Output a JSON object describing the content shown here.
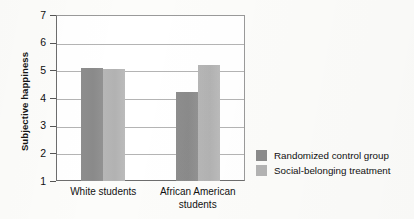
{
  "chart_data": {
    "type": "bar",
    "title": "",
    "xlabel": "",
    "ylabel": "Subjective happiness",
    "ylim": [
      1,
      7
    ],
    "yticks": [
      1,
      2,
      3,
      4,
      5,
      6,
      7
    ],
    "grid": true,
    "legend_position": "right",
    "categories": [
      "White students",
      "African American students"
    ],
    "category_lines": [
      [
        "White students",
        ""
      ],
      [
        "African American",
        "students"
      ]
    ],
    "series": [
      {
        "name": "Randomized control group",
        "color": "#8b8b8b",
        "values": [
          5.1,
          4.2
        ]
      },
      {
        "name": "Social-belonging treatment",
        "color": "#b3b3b3",
        "values": [
          5.05,
          5.2
        ]
      }
    ]
  },
  "axis": {
    "y_title": "Subjective happiness",
    "tick_labels": [
      "7",
      "6",
      "5",
      "4",
      "3",
      "2",
      "1"
    ]
  },
  "legend": {
    "items": [
      {
        "label": "Randomized control group",
        "color": "#8b8b8b"
      },
      {
        "label": "Social-belonging treatment",
        "color": "#b3b3b3"
      }
    ]
  }
}
